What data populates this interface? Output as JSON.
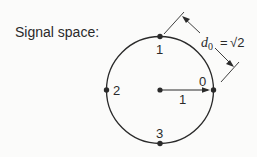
{
  "title": "Signal space:",
  "points": [
    {
      "label": "0",
      "angle_deg": 0
    },
    {
      "label": "1",
      "angle_deg": 90
    },
    {
      "label": "2",
      "angle_deg": 180
    },
    {
      "label": "3",
      "angle_deg": 270
    }
  ],
  "radius_label": "1",
  "distance_label": {
    "symbol": "d",
    "subscript": "0",
    "equals": "=",
    "value": "√2"
  },
  "colors": {
    "stroke": "#2a2a2a",
    "background": "#fbfbfa"
  }
}
